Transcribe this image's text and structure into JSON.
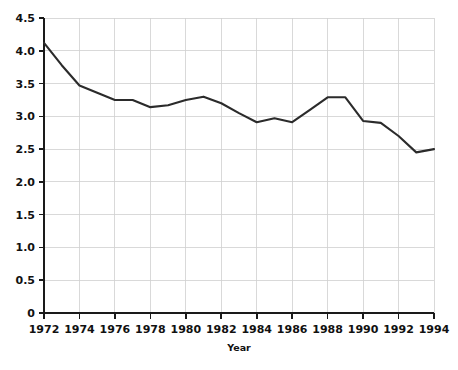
{
  "chart_data": {
    "type": "line",
    "title": "",
    "xlabel": "Year",
    "ylabel": "",
    "grid": true,
    "legend": "none",
    "xlim": [
      1972,
      1994
    ],
    "ylim": [
      0,
      4.5
    ],
    "x": [
      1972,
      1973,
      1974,
      1975,
      1976,
      1977,
      1978,
      1979,
      1980,
      1981,
      1982,
      1983,
      1984,
      1985,
      1986,
      1987,
      1988,
      1989,
      1990,
      1991,
      1992,
      1993,
      1994
    ],
    "values": [
      4.12,
      3.78,
      3.47,
      3.36,
      3.25,
      3.25,
      3.14,
      3.17,
      3.25,
      3.3,
      3.2,
      3.05,
      2.91,
      2.97,
      2.91,
      3.1,
      3.29,
      3.29,
      2.93,
      2.9,
      2.7,
      2.45,
      2.5
    ],
    "series": [
      {
        "name": "rate",
        "color": "#2b2b2b",
        "values": [
          4.12,
          3.78,
          3.47,
          3.36,
          3.25,
          3.25,
          3.14,
          3.17,
          3.25,
          3.3,
          3.2,
          3.05,
          2.91,
          2.97,
          2.91,
          3.1,
          3.29,
          3.29,
          2.93,
          2.9,
          2.7,
          2.45,
          2.5
        ]
      }
    ],
    "x_tick_labels": [
      "1972",
      "1974",
      "1976",
      "1978",
      "1980",
      "1982",
      "1984",
      "1986",
      "1988",
      "1990",
      "1992",
      "1994"
    ],
    "x_tick_values": [
      1972,
      1974,
      1976,
      1978,
      1980,
      1982,
      1984,
      1986,
      1988,
      1990,
      1992,
      1994
    ],
    "y_tick_labels": [
      "0",
      "0.5",
      "1.0",
      "1.5",
      "2.0",
      "2.5",
      "3.0",
      "3.5",
      "4.0",
      "4.5"
    ],
    "y_tick_values": [
      0,
      0.5,
      1.0,
      1.5,
      2.0,
      2.5,
      3.0,
      3.5,
      4.0,
      4.5
    ],
    "colors": {
      "line": "#2b2b2b",
      "grid": "#cfcfcf",
      "axis": "#1a1a1a",
      "text": "#111111",
      "background": "#ffffff"
    }
  }
}
